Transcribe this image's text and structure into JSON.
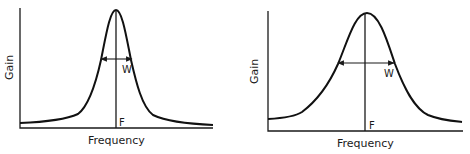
{
  "diagrams": [
    {
      "id": "narrow",
      "ylabel": "Gain",
      "xlabel": "Frequency",
      "center_label": "F",
      "width_label": "W"
    },
    {
      "id": "wide",
      "ylabel": "Gain",
      "xlabel": "Frequency",
      "center_label": "F",
      "width_label": "W"
    }
  ],
  "colors": {
    "ink": "#1a1a1a",
    "background": "#ffffff"
  }
}
